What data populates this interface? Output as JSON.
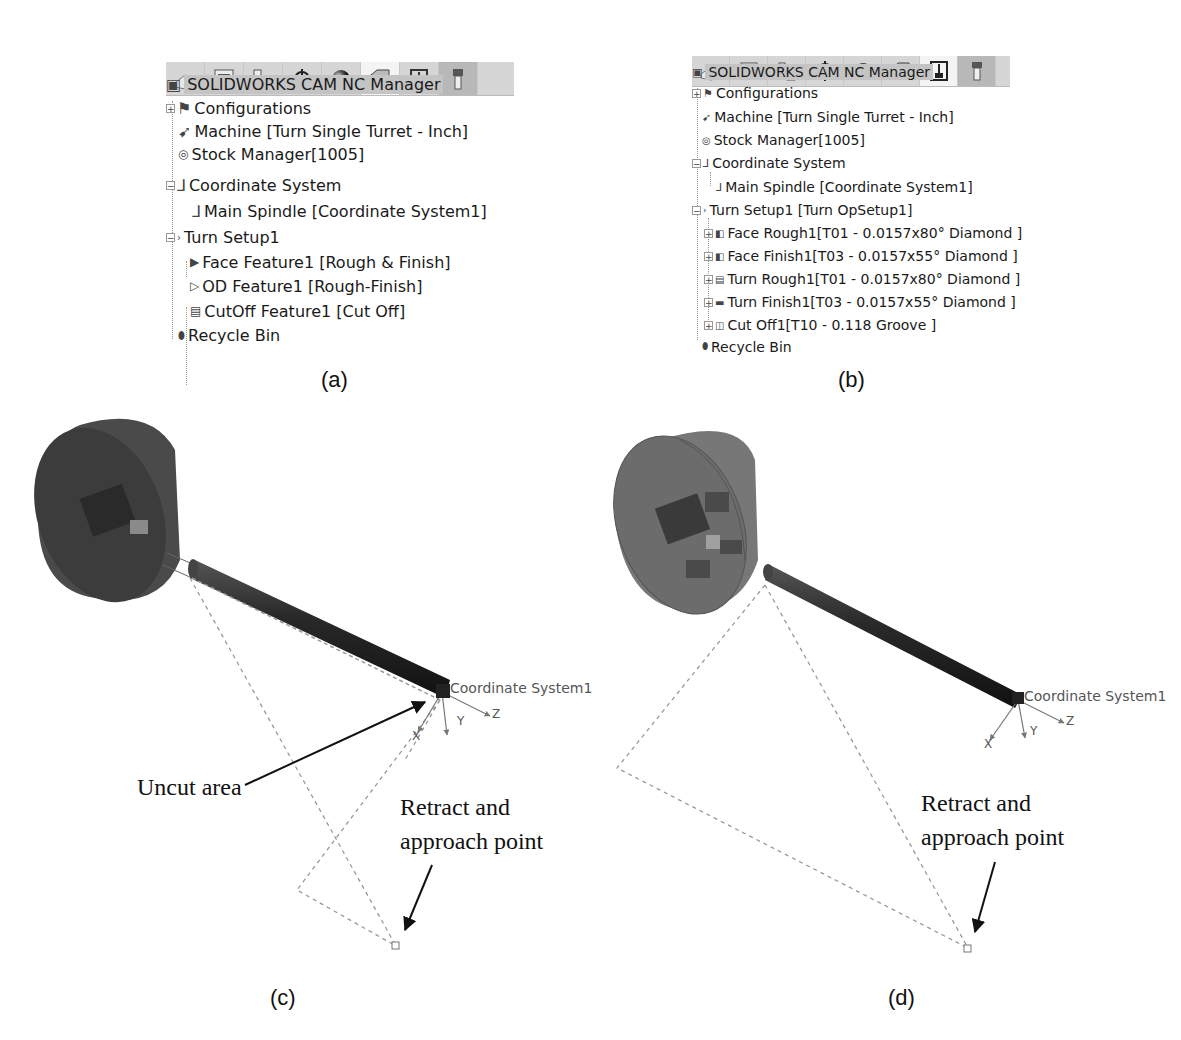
{
  "panel_a": {
    "caption": "(a)",
    "toolbar": {
      "icons": [
        "part-icon",
        "property-manager-icon",
        "config-manager-icon",
        "dimxpert-icon",
        "display-manager-icon",
        "cam-feature-tree-icon",
        "cam-operation-tree-icon",
        "cam-tool-tree-icon"
      ],
      "active_index": 5
    },
    "tree": {
      "root": "SOLIDWORKS CAM NC Manager",
      "items": [
        {
          "label": "Configurations",
          "expander": "+"
        },
        {
          "label": "Machine [Turn Single Turret - Inch]"
        },
        {
          "label": "Stock Manager[1005]"
        },
        {
          "label": "Coordinate System",
          "expander": "-"
        },
        {
          "label": "Main Spindle [Coordinate System1]"
        },
        {
          "label": "Turn Setup1",
          "expander": "-"
        },
        {
          "label": "Face Feature1 [Rough & Finish]"
        },
        {
          "label": "OD Feature1 [Rough-Finish]"
        },
        {
          "label": "CutOff Feature1 [Cut Off]"
        },
        {
          "label": "Recycle Bin"
        }
      ]
    }
  },
  "panel_b": {
    "caption": "(b)",
    "toolbar": {
      "icons": [
        "part-icon",
        "property-manager-icon",
        "config-manager-icon",
        "dimxpert-icon",
        "display-manager-icon",
        "cam-feature-tree-icon",
        "cam-operation-tree-icon",
        "cam-tool-tree-icon"
      ],
      "active_index": 6
    },
    "tree": {
      "root": "SOLIDWORKS CAM NC Manager",
      "items": [
        {
          "label": "Configurations",
          "expander": "+"
        },
        {
          "label": "Machine [Turn Single Turret - Inch]"
        },
        {
          "label": "Stock Manager[1005]"
        },
        {
          "label": "Coordinate System",
          "expander": "-"
        },
        {
          "label": "Main Spindle [Coordinate System1]"
        },
        {
          "label": "Turn Setup1 [Turn OpSetup1]",
          "expander": "-"
        },
        {
          "label": "Face Rough1[T01 - 0.0157x80° Diamond ]",
          "expander": "+"
        },
        {
          "label": "Face Finish1[T03 - 0.0157x55° Diamond ]",
          "expander": "+"
        },
        {
          "label": "Turn Rough1[T01 - 0.0157x80° Diamond ]",
          "expander": "+"
        },
        {
          "label": "Turn Finish1[T03 - 0.0157x55° Diamond ]",
          "expander": "+"
        },
        {
          "label": "Cut Off1[T10 - 0.118 Groove ]",
          "expander": "+"
        },
        {
          "label": "Recycle Bin"
        }
      ]
    }
  },
  "panel_c": {
    "caption": "(c)",
    "csys_label": "Coordinate System1",
    "axes": {
      "x": "X",
      "y": "Y",
      "z": "Z"
    },
    "annotations": {
      "uncut": "Uncut area",
      "retract_line1": "Retract and",
      "retract_line2": "approach point"
    }
  },
  "panel_d": {
    "caption": "(d)",
    "csys_label": "Coordinate System1",
    "axes": {
      "x": "X",
      "y": "Y",
      "z": "Z"
    },
    "annotations": {
      "retract_line1": "Retract and",
      "retract_line2": "approach point"
    }
  }
}
